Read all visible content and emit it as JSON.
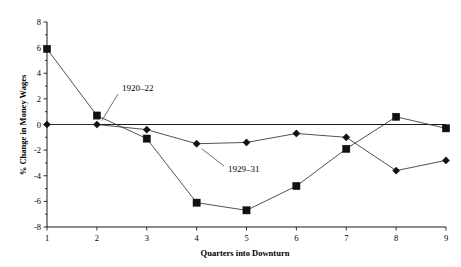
{
  "chart_data": {
    "type": "line",
    "title": "",
    "xlabel": "Quarters into Downturn",
    "ylabel": "% Change in Money Wages",
    "x": [
      1,
      2,
      3,
      4,
      5,
      6,
      7,
      8,
      9
    ],
    "xtick_labels": [
      "1",
      "2",
      "3",
      "4",
      "5",
      "6",
      "7",
      "8",
      "9"
    ],
    "xlim": [
      1,
      9
    ],
    "ylim": [
      -8,
      8
    ],
    "ytick_labels": [
      "8",
      "6",
      "4",
      "2",
      "0",
      "-2",
      "-4",
      "-6",
      "-8"
    ],
    "yticks": [
      8,
      6,
      4,
      2,
      0,
      -2,
      -4,
      -6,
      -8
    ],
    "grid": false,
    "legend_position": "inline-annotations",
    "series": [
      {
        "name": "1920-22",
        "label": "1920–22",
        "marker": "square",
        "color": "#111111",
        "values": [
          5.9,
          0.7,
          -1.1,
          -6.1,
          -6.7,
          -4.8,
          -1.9,
          0.6,
          -0.3
        ]
      },
      {
        "name": "1929-31",
        "label": "1929–31",
        "marker": "diamond",
        "color": "#111111",
        "values": [
          0.0,
          0.0,
          -0.4,
          -1.5,
          -1.4,
          -0.7,
          -1.0,
          -3.6,
          -2.8
        ]
      }
    ],
    "annotations": [
      {
        "text": "1920–22",
        "target_x": 2,
        "target_y": 0.7
      },
      {
        "text": "1929–31",
        "target_x": 4,
        "target_y": -1.5
      }
    ]
  }
}
